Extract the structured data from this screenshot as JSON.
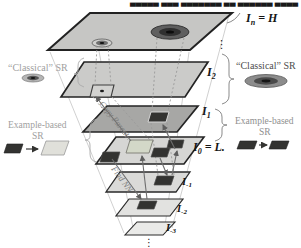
{
  "header": {
    "clipped_text": "▄▄▄▄▄ ▄▄▄ ▄▄▄▄▄▄▄ ▄▄ ▄▄▄▄▄▄ ▄▄▄▄"
  },
  "planes": [
    {
      "name": "In",
      "base": "I",
      "sub": "n",
      "rest": " = H"
    },
    {
      "name": "I2",
      "base": "I",
      "sub": "2",
      "rest": ""
    },
    {
      "name": "I1",
      "base": "I",
      "sub": "1",
      "rest": ""
    },
    {
      "name": "I0",
      "base": "I",
      "sub": "0",
      "rest": " = L."
    },
    {
      "name": "Im1",
      "base": "I",
      "sub": "-1",
      "rest": ""
    },
    {
      "name": "Im2",
      "base": "I",
      "sub": "-2",
      "rest": ""
    },
    {
      "name": "Im3",
      "base": "I",
      "sub": "-3",
      "rest": ""
    }
  ],
  "ellipsis": {
    "right": "⋮",
    "bottom": "⋮"
  },
  "labels": {
    "left_classical": "“Classical” SR",
    "left_example_1": "Example-based",
    "left_example_2": "SR",
    "right_classical": "“Classical” SR",
    "right_example_1": "Example-based",
    "right_example_2": "SR"
  },
  "annotations": {
    "copy_parent": "Copy Parent",
    "find_nn": "Find NN"
  },
  "colors": {
    "plane_top": "#c6c6c4",
    "plane_i2": "#cbcbc9",
    "plane_i1": "#a7a7a5",
    "plane_i0": "#d6d6d4",
    "plane_im1": "#dadad8",
    "plane_im2": "#e2e2e0",
    "plane_im3": "#eaeae8",
    "patch_dark": "#333331",
    "patch_light": "#d3d8c8",
    "legend_light": "#e0e0da",
    "arrow": "#6e6e6e",
    "dotted": "#9a9a9a",
    "left_text": "#a0a0a0",
    "right_classical_text": "#4d4d4d",
    "right_example_text": "#8f8f8f"
  }
}
